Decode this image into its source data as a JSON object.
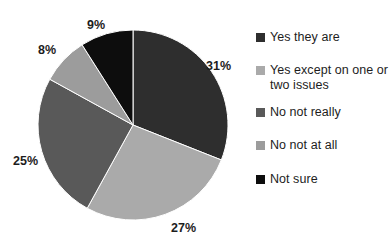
{
  "chart_data": {
    "type": "pie",
    "title": "",
    "subtitle": "",
    "xlabel": "",
    "ylabel": "",
    "grid": false,
    "legend_position": "right",
    "categories": [
      "Yes they are",
      "Yes except on one or two issues",
      "No not really",
      "No not at all",
      "Not sure"
    ],
    "values": [
      31,
      27,
      25,
      8,
      9
    ],
    "value_unit": "%",
    "data_labels": [
      "31%",
      "27%",
      "25%",
      "8%",
      "9%"
    ],
    "colors": [
      "#2e2e2e",
      "#aaaaaa",
      "#595959",
      "#9c9c9c",
      "#0d0d0d"
    ],
    "start_angle_deg": 0,
    "direction": "clockwise"
  },
  "pie": {
    "slices": [
      {
        "name": "yes-they-are",
        "label": "31%",
        "value": 31,
        "color": "#2e2e2e",
        "label_x": 206,
        "label_y": 59
      },
      {
        "name": "yes-except-one-two",
        "label": "27%",
        "value": 27,
        "color": "#aaaaaa",
        "label_x": 171,
        "label_y": 221
      },
      {
        "name": "no-not-really",
        "label": "25%",
        "value": 25,
        "color": "#595959",
        "label_x": 13,
        "label_y": 154
      },
      {
        "name": "no-not-at-all",
        "label": "8%",
        "value": 8,
        "color": "#9c9c9c",
        "label_x": 38,
        "label_y": 43
      },
      {
        "name": "not-sure",
        "label": "9%",
        "value": 9,
        "color": "#0d0d0d",
        "label_x": 87,
        "label_y": 18
      }
    ]
  },
  "legend": {
    "items": [
      {
        "label": "Yes they are",
        "color": "#2e2e2e",
        "top": 0
      },
      {
        "label": "Yes except on one or two issues",
        "color": "#aaaaaa",
        "top": 33
      },
      {
        "label": "No not really",
        "color": "#595959",
        "top": 75
      },
      {
        "label": "No not at all",
        "color": "#9c9c9c",
        "top": 108
      },
      {
        "label": "Not sure",
        "color": "#0d0d0d",
        "top": 142
      }
    ]
  }
}
